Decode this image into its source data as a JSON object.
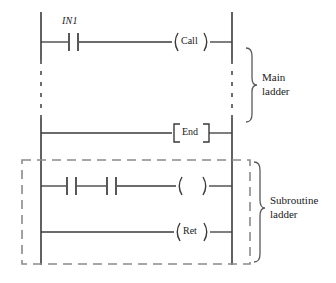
{
  "diagram": {
    "type": "ladder-diagram",
    "line_color": "#3a3a3a",
    "dashed_color": "#8a8a8a",
    "text_color": "#1a1a1a",
    "background": "#ffffff"
  },
  "main_ladder": {
    "brace_label_line1": "Main",
    "brace_label_line2": "ladder",
    "rungs": [
      {
        "name": "call-rung",
        "contacts": [
          {
            "type": "normally-open",
            "label": "IN1"
          }
        ],
        "coil": {
          "bracket": "round",
          "text": "Call"
        }
      },
      {
        "name": "end-rung",
        "contacts": [],
        "coil": {
          "bracket": "square",
          "text": "End"
        }
      }
    ]
  },
  "subroutine_ladder": {
    "brace_label_line1": "Subroutine",
    "brace_label_line2": "ladder",
    "boundary": "dashed-rectangle",
    "rungs": [
      {
        "name": "subroutine-logic-rung",
        "contacts": [
          {
            "type": "normally-open",
            "label": ""
          },
          {
            "type": "normally-open",
            "label": ""
          }
        ],
        "coil": {
          "bracket": "round",
          "text": ""
        }
      },
      {
        "name": "return-rung",
        "contacts": [],
        "coil": {
          "bracket": "round",
          "text": "Ret"
        }
      }
    ]
  },
  "rails": {
    "left_label": "left-power-rail",
    "right_label": "right-power-rail",
    "break_style": "dashed"
  }
}
